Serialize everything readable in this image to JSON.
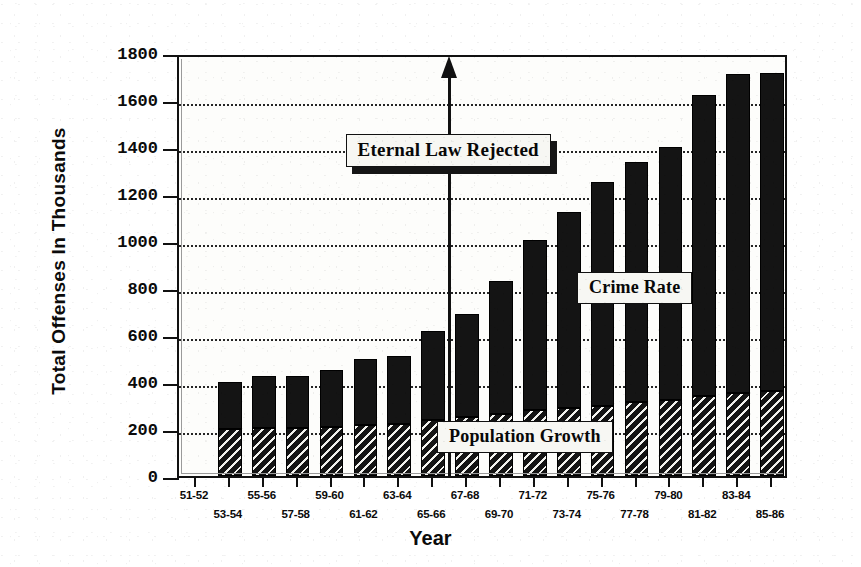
{
  "chart_data": {
    "type": "bar",
    "title": "",
    "xlabel": "Year",
    "ylabel": "Total Offenses In Thousands",
    "ylim": [
      0,
      1800
    ],
    "ytick_step": 200,
    "yticks": [
      "0",
      "200",
      "400",
      "600",
      "800",
      "1000",
      "1200",
      "1400",
      "1600",
      "1800"
    ],
    "grid": true,
    "stacked": true,
    "legend_position": "inline-annotations",
    "categories": [
      "51-52",
      "53-54",
      "55-56",
      "57-58",
      "59-60",
      "61-62",
      "63-64",
      "65-66",
      "67-68",
      "69-70",
      "71-72",
      "73-74",
      "75-76",
      "77-78",
      "79-80",
      "81-82",
      "83-84",
      "85-86"
    ],
    "category_rows": [
      0,
      1,
      0,
      1,
      0,
      1,
      0,
      1,
      0,
      1,
      0,
      1,
      0,
      1,
      0,
      1,
      0,
      1
    ],
    "series": [
      {
        "name": "Crime Rate",
        "values": [
          null,
          400,
          425,
          425,
          450,
          500,
          510,
          615,
          690,
          830,
          1005,
          1125,
          1250,
          1335,
          1400,
          1620,
          1710,
          1640
        ]
      },
      {
        "name": "Population Growth",
        "values": [
          null,
          200,
          205,
          205,
          210,
          215,
          220,
          240,
          250,
          265,
          280,
          290,
          300,
          315,
          325,
          340,
          355,
          360
        ]
      }
    ],
    "bars": [
      {
        "category": "51-52",
        "total": null,
        "population": null
      },
      {
        "category": "53-54",
        "total": 400,
        "population": 200
      },
      {
        "category": "55-56",
        "total": 425,
        "population": 205
      },
      {
        "category": "57-58",
        "total": 425,
        "population": 205
      },
      {
        "category": "59-60",
        "total": 450,
        "population": 210
      },
      {
        "category": "61-62",
        "total": 500,
        "population": 215
      },
      {
        "category": "63-64",
        "total": 510,
        "population": 220
      },
      {
        "category": "65-66",
        "total": 615,
        "population": 240
      },
      {
        "category": "67-68",
        "total": 690,
        "population": 250
      },
      {
        "category": "69-70",
        "total": 830,
        "population": 265
      },
      {
        "category": "71-72",
        "total": 1005,
        "population": 280
      },
      {
        "category": "73-74",
        "total": 1125,
        "population": 290
      },
      {
        "category": "75-76",
        "total": 1250,
        "population": 300
      },
      {
        "category": "77-78",
        "total": 1335,
        "population": 315
      },
      {
        "category": "79-80",
        "total": 1400,
        "population": 325
      },
      {
        "category": "81-82",
        "total": 1620,
        "population": 340
      },
      {
        "category": "83-84",
        "total": 1710,
        "population": 355
      },
      {
        "category": "85-86",
        "total": 1640,
        "population": 360
      },
      {
        "category": "85-86b",
        "total": 1715,
        "population": 360
      }
    ],
    "annotations": [
      {
        "id": "eternal-law",
        "text": "Eternal Law Rejected",
        "kind": "callout-with-arrow",
        "arrow_at_category": "65-66",
        "arrow_direction": "up",
        "arrow_top_value": 1800
      },
      {
        "id": "crime-rate",
        "text": "Crime Rate",
        "kind": "series-label",
        "series": "Crime Rate"
      },
      {
        "id": "population-growth",
        "text": "Population Growth",
        "kind": "series-label",
        "series": "Population Growth"
      }
    ],
    "colors": {
      "bar_solid": "#141414",
      "bar_hatch_line": "#f2f2ee",
      "axis": "#111111",
      "grid": "#1a1a1a",
      "background": "#ffffff",
      "callout_bg": "#f7f7f3",
      "callout_shadow": "#151515"
    }
  }
}
